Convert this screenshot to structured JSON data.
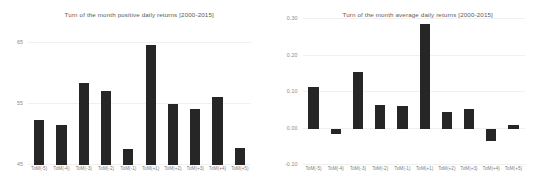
{
  "figure": {
    "panels": [
      {
        "id": "positive-daily-returns",
        "title": "Turn of the month positive daily returns [2000-2015]"
      },
      {
        "id": "average-daily-returns",
        "title": "Turn of the month average daily returns [2000-2015]"
      }
    ],
    "bar_color": "#262626",
    "grid_color": "#f0f0f0",
    "tick_color": "#8a8a8a",
    "title_color": "#5b5b5b"
  },
  "chart_data": [
    {
      "type": "bar",
      "title": "Turn of the month positive daily returns [2000-2015]",
      "xlabel": "",
      "ylabel": "",
      "categories": [
        "ToM(-5)",
        "ToM(-4)",
        "ToM(-3)",
        "ToM(-2)",
        "ToM(-1)",
        "ToM(+1)",
        "ToM(+2)",
        "ToM(+3)",
        "ToM(+4)",
        "ToM(+5)"
      ],
      "values": [
        52.3,
        51.5,
        58.5,
        57.2,
        47.7,
        64.7,
        55.0,
        54.2,
        56.2,
        47.8
      ],
      "ylim": [
        45,
        65
      ],
      "yticks": [
        45,
        55,
        65
      ],
      "ytick_labels": [
        "45",
        "55",
        "65"
      ],
      "grid": true,
      "legend": "none"
    },
    {
      "type": "bar",
      "title": "Turn of the month average daily returns [2000-2015]",
      "xlabel": "",
      "ylabel": "",
      "categories": [
        "ToM(-5)",
        "ToM(-4)",
        "ToM(-3)",
        "ToM(-2)",
        "ToM(-1)",
        "ToM(+1)",
        "ToM(+2)",
        "ToM(+3)",
        "ToM(+4)",
        "ToM(+5)"
      ],
      "values": [
        0.115,
        -0.015,
        0.155,
        0.065,
        0.063,
        0.285,
        0.045,
        0.053,
        -0.035,
        0.01
      ],
      "ylim": [
        -0.1,
        0.3
      ],
      "yticks": [
        -0.1,
        0.0,
        0.1,
        0.2,
        0.3
      ],
      "ytick_labels": [
        "-0.10",
        "0.00",
        "0.10",
        "0.20",
        "0.30"
      ],
      "grid": true,
      "legend": "none"
    }
  ]
}
